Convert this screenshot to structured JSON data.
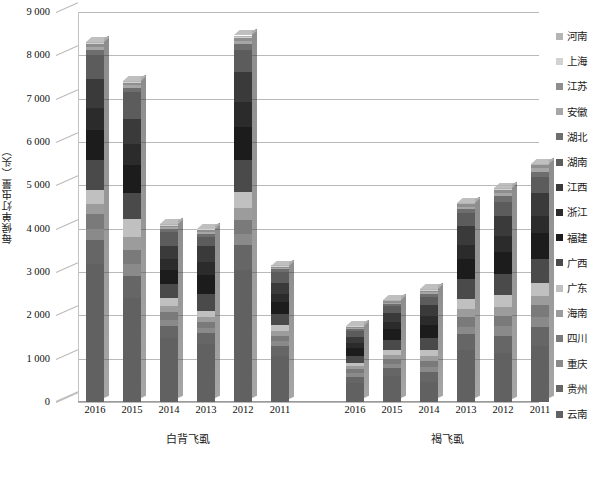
{
  "chart_data": {
    "type": "bar",
    "subtype": "stacked-column-3d",
    "title": "",
    "xlabel": "",
    "ylabel": "每候单灯虫量（头）",
    "ylim": [
      0,
      9000
    ],
    "ytick_step": 1000,
    "yticks": [
      "0",
      "1 000",
      "2 000",
      "3 000",
      "4 000",
      "5 000",
      "6 000",
      "7 000",
      "8 000",
      "9 000"
    ],
    "grid": true,
    "legend_position": "right",
    "groups": [
      {
        "label": "白背飞虱",
        "categories": [
          "2016",
          "2015",
          "2014",
          "2013",
          "2012",
          "2011"
        ]
      },
      {
        "label": "褐飞虱",
        "categories": [
          "2016",
          "2015",
          "2014",
          "2013",
          "2012",
          "2011"
        ]
      }
    ],
    "categories": [
      "2016",
      "2015",
      "2014",
      "2013",
      "2012",
      "2011",
      "2016",
      "2015",
      "2014",
      "2013",
      "2012",
      "2011"
    ],
    "series": [
      {
        "name": "河南",
        "color": "#b4b4b4",
        "values": [
          20,
          15,
          10,
          12,
          25,
          10,
          8,
          10,
          12,
          15,
          20,
          18
        ]
      },
      {
        "name": "上海",
        "color": "#d2d2d2",
        "values": [
          25,
          20,
          15,
          15,
          30,
          12,
          10,
          12,
          15,
          18,
          25,
          22
        ]
      },
      {
        "name": "江苏",
        "color": "#8e8e8e",
        "values": [
          60,
          50,
          35,
          40,
          70,
          30,
          25,
          30,
          40,
          55,
          70,
          65
        ]
      },
      {
        "name": "安徽",
        "color": "#a6a6a6",
        "values": [
          70,
          60,
          40,
          45,
          80,
          35,
          30,
          35,
          45,
          60,
          80,
          75
        ]
      },
      {
        "name": "湖北",
        "color": "#6e6e6e",
        "values": [
          120,
          100,
          70,
          75,
          140,
          60,
          45,
          55,
          70,
          95,
          130,
          120
        ]
      },
      {
        "name": "湖南",
        "color": "#5c5c5c",
        "values": [
          560,
          620,
          330,
          210,
          500,
          260,
          120,
          150,
          180,
          300,
          340,
          380
        ]
      },
      {
        "name": "江西",
        "color": "#3a3a3a",
        "values": [
          650,
          590,
          300,
          380,
          700,
          240,
          150,
          210,
          260,
          420,
          460,
          520
        ]
      },
      {
        "name": "浙江",
        "color": "#2b2b2b",
        "values": [
          520,
          470,
          250,
          300,
          560,
          200,
          120,
          170,
          200,
          330,
          360,
          410
        ]
      },
      {
        "name": "福建",
        "color": "#1c1c1c",
        "values": [
          700,
          640,
          330,
          420,
          760,
          270,
          170,
          240,
          290,
          470,
          510,
          580
        ]
      },
      {
        "name": "广西",
        "color": "#4a4a4a",
        "values": [
          690,
          600,
          320,
          400,
          740,
          260,
          160,
          230,
          280,
          450,
          490,
          560
        ]
      },
      {
        "name": "广东",
        "color": "#c0c0c0",
        "values": [
          320,
          430,
          190,
          150,
          380,
          140,
          90,
          120,
          150,
          240,
          270,
          300
        ]
      },
      {
        "name": "海南",
        "color": "#9c9c9c",
        "values": [
          230,
          300,
          140,
          110,
          280,
          100,
          70,
          90,
          110,
          180,
          200,
          220
        ]
      },
      {
        "name": "四川",
        "color": "#7a7a7a",
        "values": [
          340,
          330,
          170,
          140,
          320,
          130,
          90,
          110,
          140,
          220,
          250,
          270
        ]
      },
      {
        "name": "重庆",
        "color": "#8a8a8a",
        "values": [
          260,
          260,
          140,
          120,
          260,
          110,
          80,
          95,
          115,
          180,
          210,
          230
        ]
      },
      {
        "name": "贵州",
        "color": "#666666",
        "values": [
          540,
          520,
          280,
          250,
          560,
          220,
          140,
          190,
          230,
          360,
          400,
          440
        ]
      },
      {
        "name": "云南",
        "color": "#616161",
        "values": [
          3195,
          2395,
          1480,
          1332,
          3055,
          1073,
          442,
          603,
          463,
          1202,
          1135,
          1290
        ]
      }
    ],
    "totals": [
      8300,
      7400,
      4100,
      3900,
      8450,
      3150,
      1750,
      2350,
      2500,
      4600,
      4850,
      4950
    ]
  },
  "legend": {
    "items": [
      {
        "label": "河南",
        "color": "#b4b4b4"
      },
      {
        "label": "上海",
        "color": "#d2d2d2"
      },
      {
        "label": "江苏",
        "color": "#8e8e8e"
      },
      {
        "label": "安徽",
        "color": "#a6a6a6"
      },
      {
        "label": "湖北",
        "color": "#6e6e6e"
      },
      {
        "label": "湖南",
        "color": "#5c5c5c"
      },
      {
        "label": "江西",
        "color": "#3a3a3a"
      },
      {
        "label": "浙江",
        "color": "#2b2b2b"
      },
      {
        "label": "福建",
        "color": "#1c1c1c"
      },
      {
        "label": "广西",
        "color": "#4a4a4a"
      },
      {
        "label": "广东",
        "color": "#c0c0c0"
      },
      {
        "label": "海南",
        "color": "#9c9c9c"
      },
      {
        "label": "四川",
        "color": "#7a7a7a"
      },
      {
        "label": "重庆",
        "color": "#8a8a8a"
      },
      {
        "label": "贵州",
        "color": "#666666"
      },
      {
        "label": "云南",
        "color": "#616161"
      }
    ]
  },
  "caption": ""
}
